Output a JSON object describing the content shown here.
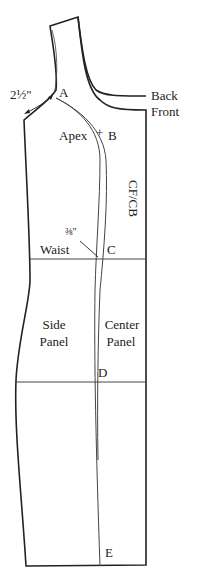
{
  "diagram": {
    "type": "sewing pattern draft",
    "colors": {
      "outline": "#222222",
      "guide": "#444444",
      "background": "#ffffff"
    }
  },
  "labels": {
    "measurement_shoulder": "2½\"",
    "point_a": "A",
    "back": "Back",
    "front": "Front",
    "apex": "Apex",
    "point_b": "B",
    "cf_cb": "CF/CB",
    "measurement_waist": "⅜\"",
    "waist": "Waist",
    "point_c": "C",
    "side_panel_line1": "Side",
    "side_panel_line2": "Panel",
    "center_panel_line1": "Center",
    "center_panel_line2": "Panel",
    "point_d": "D",
    "point_e": "E"
  }
}
